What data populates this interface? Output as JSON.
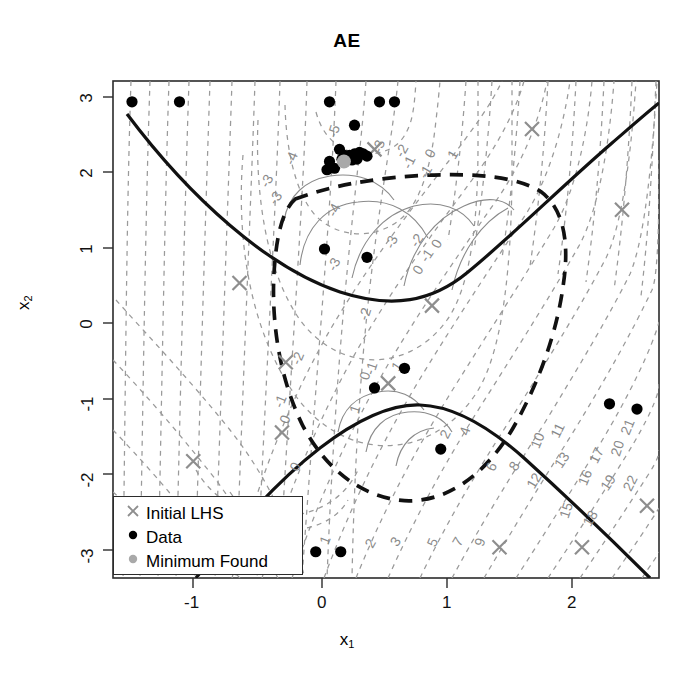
{
  "chart_data": {
    "type": "scatter",
    "title": "AE",
    "xlabel": "x1",
    "ylabel": "x2",
    "xlim": [
      -1.68,
      2.7
    ],
    "ylim": [
      -3.3,
      3.25
    ],
    "xticks": [
      -1,
      0,
      1,
      2
    ],
    "yticks": [
      -3,
      -2,
      -1,
      0,
      1,
      2,
      3
    ],
    "grid": false,
    "legend_position": "bottom-left",
    "legend": [
      {
        "label": "Initial LHS",
        "marker": "x",
        "color": "#8e8e8e"
      },
      {
        "label": "Data",
        "marker": "circle",
        "color": "#000000"
      },
      {
        "label": "Minimum Found",
        "marker": "circle",
        "color": "#a9a9a9"
      }
    ],
    "contour_label_values": [
      -5,
      -4,
      -3,
      -2,
      -1,
      0,
      1,
      2,
      3,
      4,
      5,
      6,
      7,
      8,
      9,
      10,
      11,
      12,
      13,
      15,
      16,
      17,
      18,
      19,
      20,
      21,
      22
    ],
    "contour_labels": [
      {
        "text": "-5",
        "x": 0.13,
        "y": 2.52
      },
      {
        "text": "-4",
        "x": -0.21,
        "y": 2.16
      },
      {
        "text": "-4",
        "x": 0.13,
        "y": 1.47
      },
      {
        "text": "-3",
        "x": -0.41,
        "y": 1.85
      },
      {
        "text": "-3",
        "x": -0.34,
        "y": 1.62
      },
      {
        "text": "-3",
        "x": 0.49,
        "y": 2.32
      },
      {
        "text": "-3",
        "x": 0.59,
        "y": 1.05
      },
      {
        "text": "-3",
        "x": 0.13,
        "y": 0.75
      },
      {
        "text": "-2",
        "x": 0.67,
        "y": 2.25
      },
      {
        "text": "-2",
        "x": 0.79,
        "y": 1.06
      },
      {
        "text": "-2",
        "x": 0.38,
        "y": 0.1
      },
      {
        "text": "-2",
        "x": -0.16,
        "y": -0.49
      },
      {
        "text": "-1",
        "x": 0.73,
        "y": 2.1
      },
      {
        "text": "-1",
        "x": 0.86,
        "y": 1.97
      },
      {
        "text": "-1",
        "x": 0.87,
        "y": 0.86
      },
      {
        "text": "-1",
        "x": 0.43,
        "y": -0.62
      },
      {
        "text": "-1",
        "x": -0.3,
        "y": -1.06
      },
      {
        "text": "0",
        "x": 0.9,
        "y": 2.22
      },
      {
        "text": "0",
        "x": 0.95,
        "y": 1.02
      },
      {
        "text": "0",
        "x": 0.8,
        "y": 0.67
      },
      {
        "text": "0",
        "x": 0.38,
        "y": -0.72
      },
      {
        "text": "0",
        "x": -0.26,
        "y": -1.3
      },
      {
        "text": "0",
        "x": -0.18,
        "y": -1.93
      },
      {
        "text": "1",
        "x": 1.08,
        "y": 2.2
      },
      {
        "text": "1",
        "x": 0.63,
        "y": -0.61
      },
      {
        "text": "1",
        "x": 0.3,
        "y": -1.16
      },
      {
        "text": "1",
        "x": 0.06,
        "y": -2.9
      },
      {
        "text": "2",
        "x": 1.02,
        "y": -1.5
      },
      {
        "text": "2",
        "x": 0.42,
        "y": -2.95
      },
      {
        "text": "3",
        "x": 0.62,
        "y": -2.93
      },
      {
        "text": "4",
        "x": 1.18,
        "y": -1.45
      },
      {
        "text": "5",
        "x": 0.92,
        "y": -2.93
      },
      {
        "text": "6",
        "x": 1.39,
        "y": -1.93
      },
      {
        "text": "7",
        "x": 1.12,
        "y": -2.93
      },
      {
        "text": "8",
        "x": 1.57,
        "y": -1.93
      },
      {
        "text": "9",
        "x": 1.3,
        "y": -2.92
      },
      {
        "text": "10",
        "x": 1.76,
        "y": -1.58
      },
      {
        "text": "11",
        "x": 1.92,
        "y": -1.45
      },
      {
        "text": "12",
        "x": 1.73,
        "y": -2.12
      },
      {
        "text": "13",
        "x": 1.95,
        "y": -1.85
      },
      {
        "text": "15",
        "x": 1.99,
        "y": -2.5
      },
      {
        "text": "16",
        "x": 2.14,
        "y": -2.07
      },
      {
        "text": "17",
        "x": 2.23,
        "y": -1.78
      },
      {
        "text": "18",
        "x": 2.18,
        "y": -2.62
      },
      {
        "text": "19",
        "x": 2.32,
        "y": -2.15
      },
      {
        "text": "20",
        "x": 2.4,
        "y": -1.68
      },
      {
        "text": "21",
        "x": 2.48,
        "y": -1.4
      },
      {
        "text": "22",
        "x": 2.5,
        "y": -2.15
      }
    ],
    "initial_lhs": [
      {
        "x": 1.68,
        "y": 2.57
      },
      {
        "x": 2.4,
        "y": 1.5
      },
      {
        "x": 0.42,
        "y": 2.3
      },
      {
        "x": -0.66,
        "y": 0.53
      },
      {
        "x": 0.88,
        "y": 0.23
      },
      {
        "x": 0.53,
        "y": -0.8
      },
      {
        "x": -0.29,
        "y": -0.52
      },
      {
        "x": -1.03,
        "y": -1.83
      },
      {
        "x": -0.32,
        "y": -1.45
      },
      {
        "x": 1.42,
        "y": -2.97
      },
      {
        "x": 2.08,
        "y": -2.97
      },
      {
        "x": 2.6,
        "y": -2.42
      }
    ],
    "data_points": [
      {
        "x": -1.52,
        "y": 2.93
      },
      {
        "x": -1.14,
        "y": 2.93
      },
      {
        "x": 0.06,
        "y": 2.93
      },
      {
        "x": 0.46,
        "y": 2.93
      },
      {
        "x": 0.58,
        "y": 2.93
      },
      {
        "x": 0.26,
        "y": 2.62
      },
      {
        "x": 0.14,
        "y": 2.3
      },
      {
        "x": 0.18,
        "y": 2.22
      },
      {
        "x": 0.22,
        "y": 2.22
      },
      {
        "x": 0.26,
        "y": 2.24
      },
      {
        "x": 0.3,
        "y": 2.26
      },
      {
        "x": 0.33,
        "y": 2.24
      },
      {
        "x": 0.36,
        "y": 2.21
      },
      {
        "x": 0.16,
        "y": 2.17
      },
      {
        "x": 0.2,
        "y": 2.16
      },
      {
        "x": 0.24,
        "y": 2.16
      },
      {
        "x": 0.28,
        "y": 2.17
      },
      {
        "x": 0.06,
        "y": 2.14
      },
      {
        "x": 0.1,
        "y": 2.05
      },
      {
        "x": 0.04,
        "y": 2.03
      },
      {
        "x": 0.02,
        "y": 0.98
      },
      {
        "x": 0.36,
        "y": 0.87
      },
      {
        "x": 0.66,
        "y": -0.6
      },
      {
        "x": 0.42,
        "y": -0.86
      },
      {
        "x": 0.95,
        "y": -1.67
      },
      {
        "x": 2.3,
        "y": -1.07
      },
      {
        "x": 2.52,
        "y": -1.14
      },
      {
        "x": -0.05,
        "y": -3.03
      },
      {
        "x": 0.15,
        "y": -3.03
      }
    ],
    "minimum_found": {
      "x": 0.175,
      "y": 2.14
    }
  },
  "legend_items": [
    {
      "label": "Initial LHS"
    },
    {
      "label": "Data"
    },
    {
      "label": "Minimum Found"
    }
  ],
  "axes": {
    "title": "AE",
    "x_title_base": "x",
    "x_title_sub": "1",
    "y_title_base": "x",
    "y_title_sub": "2",
    "xtick_labels": [
      "-1",
      "0",
      "1",
      "2"
    ],
    "ytick_labels": [
      "3",
      "2",
      "1",
      "0",
      "-1",
      "-2",
      "-3"
    ]
  },
  "colors": {
    "contour_line": "#9a9a9a",
    "constraint_line": "#000000",
    "feasible_boundary": "#000000",
    "data_marker": "#000000",
    "lhs_marker": "#8e8e8e",
    "minimum_marker": "#a9a9a9",
    "frame": "#2b2b2b"
  }
}
